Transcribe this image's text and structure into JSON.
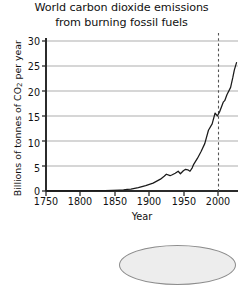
{
  "chart_data": {
    "type": "line",
    "title": "World carbon dioxide emissions from burning fossil fuels",
    "title_lines": [
      "World carbon dioxide emissions",
      "from burning fossil fuels"
    ],
    "xlabel": "Year",
    "ylabel": "Billions of tonnes of CO2 per year",
    "ylabel_prefix": "Billions of tonnes of CO",
    "ylabel_subscript": "2",
    "ylabel_suffix": " per year",
    "xlim": [
      1750,
      2010
    ],
    "ylim": [
      0,
      31
    ],
    "xticks": [
      1750,
      1800,
      1850,
      1900,
      1950,
      2000
    ],
    "xtick_labels": [
      "1750",
      "1800",
      "1850",
      "1900",
      "1950",
      "2000"
    ],
    "yticks": [
      0,
      5,
      10,
      15,
      20,
      25,
      30
    ],
    "ytick_labels": [
      "0",
      "5",
      "10",
      "15",
      "20",
      "25",
      "30"
    ],
    "grid": "horizontal",
    "grid_color": "#c9c9c9",
    "line_color": "#1a1a1a",
    "axis_color": "#2b2b2b",
    "legend": null,
    "annotations": [
      {
        "type": "vertical-dashed-line",
        "x": 2000,
        "label": "2000",
        "color": "#555555"
      }
    ],
    "x": [
      1750,
      1760,
      1770,
      1780,
      1790,
      1800,
      1810,
      1820,
      1830,
      1840,
      1850,
      1855,
      1860,
      1865,
      1870,
      1875,
      1880,
      1885,
      1890,
      1895,
      1900,
      1905,
      1910,
      1913,
      1918,
      1921,
      1925,
      1929,
      1932,
      1936,
      1939,
      1942,
      1945,
      1948,
      1950,
      1955,
      1960,
      1965,
      1970,
      1975,
      1979,
      1982,
      1985,
      1990,
      1992,
      1995,
      2000,
      2003,
      2005,
      2008
    ],
    "y": [
      0.01,
      0.02,
      0.02,
      0.03,
      0.03,
      0.03,
      0.05,
      0.06,
      0.08,
      0.13,
      0.2,
      0.25,
      0.33,
      0.4,
      0.55,
      0.7,
      0.9,
      1.1,
      1.35,
      1.6,
      2.0,
      2.4,
      3.0,
      3.4,
      3.1,
      3.3,
      3.6,
      4.0,
      3.5,
      4.1,
      4.4,
      4.3,
      4.0,
      4.7,
      5.4,
      6.6,
      8.0,
      9.6,
      12.3,
      13.6,
      15.8,
      15.2,
      16.0,
      18.0,
      18.3,
      19.5,
      21.0,
      23.0,
      24.5,
      26.0
    ]
  }
}
